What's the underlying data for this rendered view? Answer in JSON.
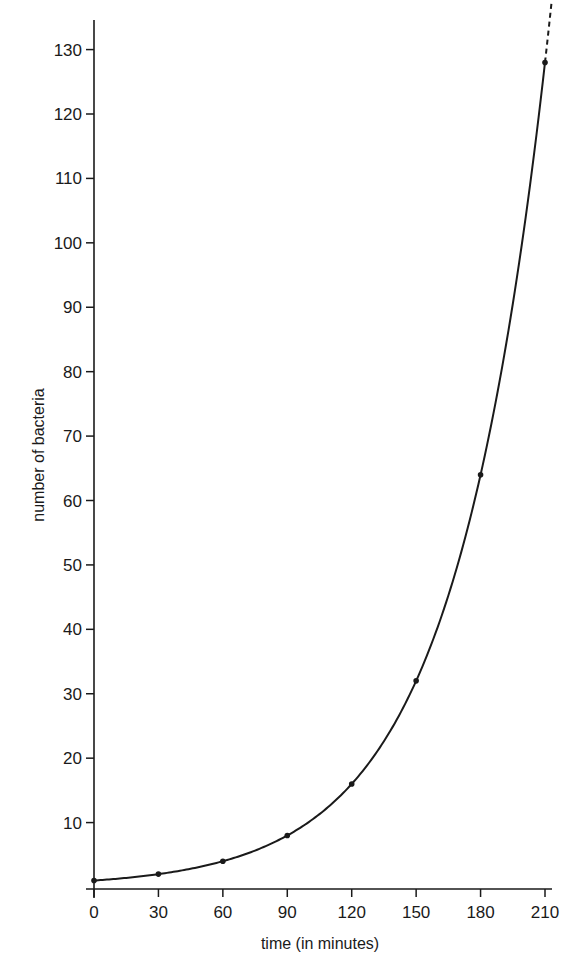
{
  "chart_data": {
    "type": "line",
    "title": "",
    "xlabel": "time (in minutes)",
    "ylabel": "number of bacteria",
    "x": [
      0,
      30,
      60,
      90,
      120,
      150,
      180,
      210
    ],
    "series": [
      {
        "name": "bacteria",
        "values": [
          1,
          2,
          4,
          8,
          16,
          32,
          64,
          128
        ]
      }
    ],
    "x_ticks": [
      0,
      30,
      60,
      90,
      120,
      150,
      180,
      210
    ],
    "y_ticks": [
      10,
      20,
      30,
      40,
      50,
      60,
      70,
      80,
      90,
      100,
      110,
      120,
      130
    ],
    "xlim": [
      0,
      210
    ],
    "ylim": [
      0,
      135
    ],
    "grid": false,
    "legend": "none",
    "annotations": [
      "dashed extension of curve beyond 210 minutes"
    ],
    "line_color": "#1a1a1a"
  }
}
